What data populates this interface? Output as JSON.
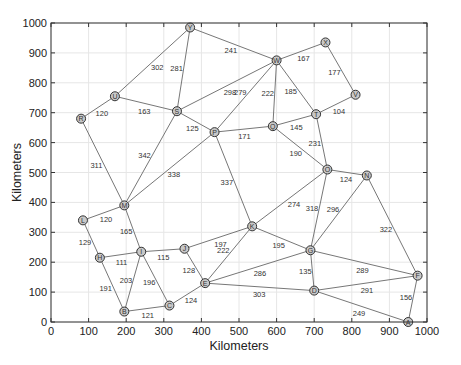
{
  "chart_data": {
    "type": "scatter",
    "title": "",
    "xlabel": "Kilometers",
    "ylabel": "Kilometers",
    "xlim": [
      0,
      1000
    ],
    "ylim": [
      0,
      1000
    ],
    "xticks": [
      0,
      100,
      200,
      300,
      400,
      500,
      600,
      700,
      800,
      900,
      1000
    ],
    "yticks": [
      0,
      100,
      200,
      300,
      400,
      500,
      600,
      700,
      800,
      900,
      1000
    ],
    "grid": true,
    "nodes": [
      {
        "id": "A",
        "x": 950,
        "y": 0
      },
      {
        "id": "B",
        "x": 195,
        "y": 35
      },
      {
        "id": "C",
        "x": 315,
        "y": 55
      },
      {
        "id": "D",
        "x": 700,
        "y": 105
      },
      {
        "id": "E",
        "x": 410,
        "y": 130
      },
      {
        "id": "F",
        "x": 975,
        "y": 155
      },
      {
        "id": "G",
        "x": 690,
        "y": 240
      },
      {
        "id": "H",
        "x": 130,
        "y": 215
      },
      {
        "id": "I",
        "x": 240,
        "y": 235
      },
      {
        "id": "J",
        "x": 355,
        "y": 245
      },
      {
        "id": "K",
        "x": 535,
        "y": 320
      },
      {
        "id": "L",
        "x": 85,
        "y": 340
      },
      {
        "id": "M",
        "x": 195,
        "y": 390
      },
      {
        "id": "N",
        "x": 840,
        "y": 490
      },
      {
        "id": "O",
        "x": 735,
        "y": 510
      },
      {
        "id": "P",
        "x": 435,
        "y": 635
      },
      {
        "id": "Q",
        "x": 590,
        "y": 655
      },
      {
        "id": "R",
        "x": 80,
        "y": 680
      },
      {
        "id": "S",
        "x": 335,
        "y": 705
      },
      {
        "id": "T",
        "x": 705,
        "y": 695
      },
      {
        "id": "U",
        "x": 170,
        "y": 755
      },
      {
        "id": "V",
        "x": 810,
        "y": 760
      },
      {
        "id": "W",
        "x": 600,
        "y": 875
      },
      {
        "id": "X",
        "x": 730,
        "y": 935
      },
      {
        "id": "Y",
        "x": 370,
        "y": 985
      }
    ],
    "edges": [
      {
        "from": "R",
        "to": "U",
        "weight": 120
      },
      {
        "from": "U",
        "to": "Y",
        "weight": 302
      },
      {
        "from": "U",
        "to": "S",
        "weight": 163
      },
      {
        "from": "Y",
        "to": "S",
        "weight": 281
      },
      {
        "from": "Y",
        "to": "W",
        "weight": 241
      },
      {
        "from": "S",
        "to": "W",
        "weight": 298
      },
      {
        "from": "S",
        "to": "P",
        "weight": 125
      },
      {
        "from": "S",
        "to": "M",
        "weight": 342
      },
      {
        "from": "R",
        "to": "M",
        "weight": 311
      },
      {
        "from": "M",
        "to": "P",
        "weight": 338
      },
      {
        "from": "W",
        "to": "X",
        "weight": 167
      },
      {
        "from": "X",
        "to": "V",
        "weight": 177
      },
      {
        "from": "W",
        "to": "T",
        "weight": 185
      },
      {
        "from": "W",
        "to": "Q",
        "weight": 222
      },
      {
        "from": "W",
        "to": "P",
        "weight": 279
      },
      {
        "from": "T",
        "to": "V",
        "weight": 104
      },
      {
        "from": "Q",
        "to": "T",
        "weight": 145
      },
      {
        "from": "P",
        "to": "Q",
        "weight": 171
      },
      {
        "from": "Q",
        "to": "O",
        "weight": 190
      },
      {
        "from": "T",
        "to": "O",
        "weight": 231
      },
      {
        "from": "O",
        "to": "N",
        "weight": 124
      },
      {
        "from": "P",
        "to": "K",
        "weight": 337
      },
      {
        "from": "K",
        "to": "O",
        "weight": 274
      },
      {
        "from": "O",
        "to": "G",
        "weight": 318
      },
      {
        "from": "N",
        "to": "G",
        "weight": 296
      },
      {
        "from": "N",
        "to": "F",
        "weight": 322
      },
      {
        "from": "L",
        "to": "M",
        "weight": 120
      },
      {
        "from": "L",
        "to": "H",
        "weight": 129
      },
      {
        "from": "M",
        "to": "I",
        "weight": 165
      },
      {
        "from": "H",
        "to": "I",
        "weight": 111
      },
      {
        "from": "I",
        "to": "J",
        "weight": 115
      },
      {
        "from": "J",
        "to": "K",
        "weight": 197
      },
      {
        "from": "K",
        "to": "G",
        "weight": 195
      },
      {
        "from": "K",
        "to": "E",
        "weight": 222
      },
      {
        "from": "J",
        "to": "E",
        "weight": 128
      },
      {
        "from": "H",
        "to": "B",
        "weight": 191
      },
      {
        "from": "I",
        "to": "B",
        "weight": 203
      },
      {
        "from": "I",
        "to": "C",
        "weight": 196
      },
      {
        "from": "B",
        "to": "C",
        "weight": 121
      },
      {
        "from": "C",
        "to": "E",
        "weight": 124
      },
      {
        "from": "E",
        "to": "G",
        "weight": 286
      },
      {
        "from": "E",
        "to": "D",
        "weight": 303
      },
      {
        "from": "G",
        "to": "F",
        "weight": 289
      },
      {
        "from": "G",
        "to": "D",
        "weight": 135
      },
      {
        "from": "D",
        "to": "F",
        "weight": 291
      },
      {
        "from": "D",
        "to": "A",
        "weight": 249
      },
      {
        "from": "F",
        "to": "A",
        "weight": 156
      }
    ],
    "colors": {
      "edge": "#777777",
      "node_fill": "#c8c8c8",
      "node_stroke": "#333333",
      "grid": "#e6e6e6",
      "axis": "#333333"
    }
  }
}
